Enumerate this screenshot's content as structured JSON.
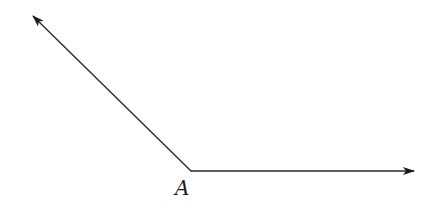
{
  "figure": {
    "type": "angle",
    "vertex_label": "A",
    "rays": [
      {
        "name": "ray-up-left",
        "direction": "up-left"
      },
      {
        "name": "ray-right",
        "direction": "right"
      }
    ],
    "stroke_color": "#2b2b2b",
    "background_color": "#ffffff"
  }
}
